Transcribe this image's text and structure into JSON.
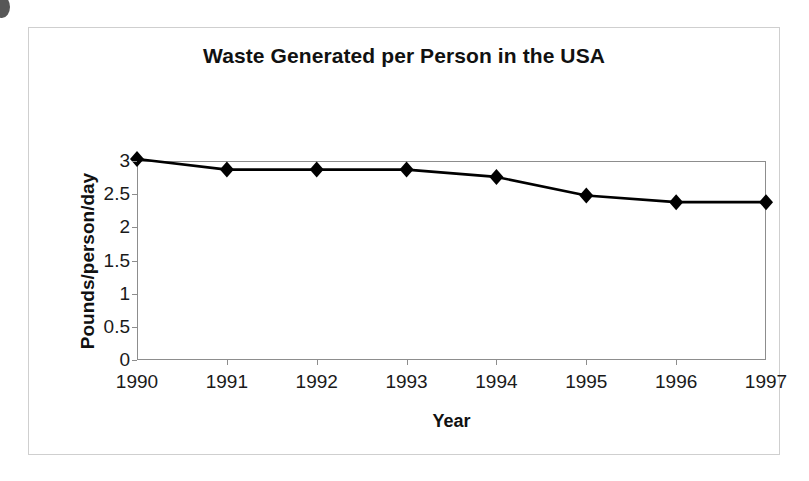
{
  "figure": {
    "title": "Waste Generated per Person in the USA"
  },
  "chart_data": {
    "type": "line",
    "title": "Waste Generated per Person in the USA",
    "xlabel": "Year",
    "ylabel": "Pounds/person/day",
    "categories": [
      "1990",
      "1991",
      "1992",
      "1993",
      "1994",
      "1995",
      "1996",
      "1997"
    ],
    "x": [
      1990,
      1991,
      1992,
      1993,
      1994,
      1995,
      1996,
      1997
    ],
    "values": [
      3.03,
      2.87,
      2.87,
      2.87,
      2.76,
      2.48,
      2.38,
      2.38
    ],
    "series": [
      {
        "name": "Pounds/person/day",
        "values": [
          3.03,
          2.87,
          2.87,
          2.87,
          2.76,
          2.48,
          2.38,
          2.38
        ]
      }
    ],
    "ylim": [
      0,
      3
    ],
    "yticks": [
      0,
      0.5,
      1,
      1.5,
      2,
      2.5,
      3
    ],
    "ytick_labels": [
      "0",
      "0.5",
      "1",
      "1.5",
      "2",
      "2.5",
      "3"
    ],
    "xtick_labels": [
      "1990",
      "1991",
      "1992",
      "1993",
      "1994",
      "1995",
      "1996",
      "1997"
    ],
    "grid": false,
    "legend": false,
    "marker": "diamond",
    "marker_color": "#000000",
    "line_color": "#000000"
  }
}
